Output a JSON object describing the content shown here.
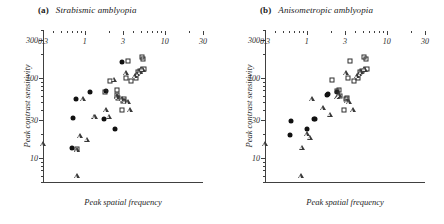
{
  "figure": {
    "background": "#ffffff",
    "ink": "#1a1a1a"
  },
  "axis": {
    "xlabel": "Peak spatial frequency",
    "ylabel": "Peak contrast sensitivity",
    "xticks": [
      "0.3",
      "1",
      "3",
      "10",
      "30"
    ],
    "yticks": [
      "10",
      "30",
      "100",
      "300"
    ],
    "xlim": [
      0.3,
      30
    ],
    "ylim": [
      5,
      400
    ],
    "xscale": "log",
    "yscale": "log",
    "grid": false
  },
  "panels": [
    {
      "tag": "(a)",
      "name": "Strabismic amblyopia"
    },
    {
      "tag": "(b)",
      "name": "Anisometropic amblyopia"
    }
  ],
  "chart_data": [
    {
      "type": "scatter",
      "title": "(a) Strabismic amblyopia",
      "xlabel": "Peak spatial frequency",
      "ylabel": "Peak contrast sensitivity",
      "xscale": "log",
      "yscale": "log",
      "xlim": [
        0.3,
        30
      ],
      "ylim": [
        5,
        400
      ],
      "grid": false,
      "legend": "none",
      "series": [
        {
          "name": "filled-circle",
          "marker": "circle-filled",
          "color": "#111111",
          "points": [
            [
              0.7,
              13.5
            ],
            [
              0.72,
              32.0
            ],
            [
              0.78,
              55.0
            ],
            [
              1.15,
              66.0
            ],
            [
              1.75,
              31.0
            ],
            [
              1.85,
              68.0
            ],
            [
              2.35,
              23.0
            ],
            [
              2.95,
              160.0
            ]
          ]
        },
        {
          "name": "open-square",
          "marker": "square-open",
          "color": "#2e2e2e",
          "points": [
            [
              0.8,
              13.0
            ],
            [
              1.8,
              66.0
            ],
            [
              2.05,
              92.0
            ],
            [
              2.55,
              70.0
            ],
            [
              2.55,
              62.0
            ],
            [
              2.6,
              56.0
            ],
            [
              2.95,
              40.0
            ],
            [
              3.0,
              52.0
            ],
            [
              3.1,
              54.0
            ],
            [
              3.25,
              100.0
            ],
            [
              3.45,
              165.0
            ],
            [
              3.8,
              92.0
            ],
            [
              4.3,
              100.0
            ],
            [
              4.6,
              120.0
            ],
            [
              4.9,
              122.0
            ],
            [
              5.2,
              185.0
            ],
            [
              5.4,
              175.0
            ],
            [
              5.55,
              130.0
            ]
          ]
        },
        {
          "name": "open-triangle",
          "marker": "triangle-open",
          "color": "#3a3a3a",
          "points": [
            [
              0.3,
              15.0
            ],
            [
              0.8,
              6.0
            ],
            [
              0.8,
              12.5
            ],
            [
              0.88,
              19.0
            ],
            [
              0.95,
              55.0
            ],
            [
              1.05,
              17.0
            ],
            [
              1.3,
              33.0
            ],
            [
              1.35,
              32.5
            ],
            [
              1.85,
              40.0
            ],
            [
              2.0,
              33.0
            ],
            [
              2.3,
              96.0
            ],
            [
              2.5,
              60.0
            ],
            [
              2.55,
              58.0
            ],
            [
              2.9,
              55.0
            ],
            [
              3.15,
              52.0
            ],
            [
              3.25,
              115.0
            ],
            [
              3.45,
              50.0
            ],
            [
              3.7,
              40.0
            ],
            [
              4.2,
              105.0
            ],
            [
              4.55,
              112.0
            ],
            [
              4.85,
              120.0
            ],
            [
              5.1,
              130.0
            ],
            [
              5.3,
              128.0
            ]
          ]
        }
      ]
    },
    {
      "type": "scatter",
      "title": "(b) Anisometropic amblyopia",
      "xlabel": "Peak spatial frequency",
      "ylabel": "Peak contrast sensitivity",
      "xscale": "log",
      "yscale": "log",
      "xlim": [
        0.3,
        30
      ],
      "ylim": [
        5,
        400
      ],
      "grid": false,
      "legend": "none",
      "series": [
        {
          "name": "filled-circle",
          "marker": "circle-filled",
          "color": "#111111",
          "points": [
            [
              0.62,
              19.5
            ],
            [
              0.63,
              29.0
            ],
            [
              1.0,
              23.0
            ],
            [
              1.22,
              30.5
            ],
            [
              1.28,
              31.0
            ],
            [
              1.8,
              62.0
            ],
            [
              1.85,
              64.0
            ],
            [
              2.35,
              66.0
            ]
          ]
        },
        {
          "name": "open-square",
          "marker": "square-open",
          "color": "#2e2e2e",
          "points": [
            [
              2.05,
              95.0
            ],
            [
              2.35,
              68.0
            ],
            [
              2.55,
              70.0
            ],
            [
              2.6,
              60.0
            ],
            [
              2.95,
              40.0
            ],
            [
              3.05,
              55.0
            ],
            [
              3.15,
              56.0
            ],
            [
              3.3,
              100.0
            ],
            [
              3.5,
              165.0
            ],
            [
              3.85,
              92.0
            ],
            [
              4.3,
              100.0
            ],
            [
              4.6,
              118.0
            ],
            [
              4.9,
              122.0
            ],
            [
              5.2,
              185.0
            ],
            [
              5.45,
              175.0
            ],
            [
              5.6,
              130.0
            ]
          ]
        },
        {
          "name": "open-triangle",
          "marker": "triangle-open",
          "color": "#3a3a3a",
          "points": [
            [
              0.3,
              15.0
            ],
            [
              0.85,
              6.0
            ],
            [
              0.88,
              13.5
            ],
            [
              1.0,
              20.0
            ],
            [
              1.1,
              18.0
            ],
            [
              1.15,
              55.0
            ],
            [
              1.6,
              42.0
            ],
            [
              1.95,
              35.0
            ],
            [
              2.4,
              58.0
            ],
            [
              2.45,
              60.0
            ],
            [
              2.55,
              62.0
            ],
            [
              3.05,
              115.0
            ],
            [
              3.2,
              52.0
            ],
            [
              3.4,
              50.0
            ],
            [
              3.75,
              40.0
            ],
            [
              4.25,
              105.0
            ],
            [
              4.55,
              112.0
            ],
            [
              4.8,
              120.0
            ],
            [
              5.15,
              130.0
            ],
            [
              5.35,
              128.0
            ]
          ]
        }
      ]
    }
  ]
}
